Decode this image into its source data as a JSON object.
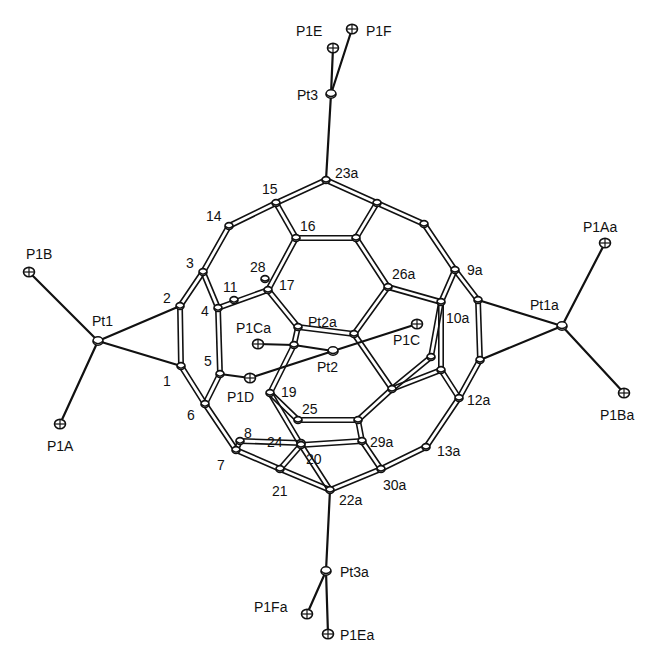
{
  "diagram": {
    "type": "ORTEP molecular structure",
    "atoms": [
      {
        "id": "P1E",
        "x": 333,
        "y": 48,
        "kind": "P",
        "label": "P1E",
        "lx": 296,
        "ly": 36
      },
      {
        "id": "P1F",
        "x": 352,
        "y": 29,
        "kind": "P",
        "label": "P1F",
        "lx": 366,
        "ly": 36
      },
      {
        "id": "Pt3",
        "x": 331,
        "y": 94,
        "kind": "Pt",
        "label": "Pt3",
        "lx": 297,
        "ly": 100
      },
      {
        "id": "C23a",
        "x": 326,
        "y": 180,
        "kind": "C",
        "label": "23a",
        "lx": 335,
        "ly": 178
      },
      {
        "id": "C15",
        "x": 276,
        "y": 203,
        "kind": "C",
        "label": "15",
        "lx": 262,
        "ly": 194
      },
      {
        "id": "C14",
        "x": 229,
        "y": 226,
        "kind": "C",
        "label": "14",
        "lx": 206,
        "ly": 221
      },
      {
        "id": "C16",
        "x": 296,
        "y": 238,
        "kind": "C",
        "label": "16",
        "lx": 300,
        "ly": 231
      },
      {
        "id": "Cb1",
        "x": 377,
        "y": 203,
        "kind": "C",
        "label": "",
        "lx": 0,
        "ly": 0
      },
      {
        "id": "Cb2",
        "x": 356,
        "y": 238,
        "kind": "C",
        "label": "",
        "lx": 0,
        "ly": 0
      },
      {
        "id": "Cb3",
        "x": 424,
        "y": 224,
        "kind": "C",
        "label": "",
        "lx": 0,
        "ly": 0
      },
      {
        "id": "C3",
        "x": 203,
        "y": 272,
        "kind": "C",
        "label": "3",
        "lx": 186,
        "ly": 268
      },
      {
        "id": "C28",
        "x": 265,
        "y": 279,
        "kind": "C",
        "label": "28",
        "lx": 250,
        "ly": 272
      },
      {
        "id": "C17",
        "x": 268,
        "y": 290,
        "kind": "C",
        "label": "17",
        "lx": 279,
        "ly": 290
      },
      {
        "id": "C11",
        "x": 234,
        "y": 300,
        "kind": "C",
        "label": "11",
        "lx": 223,
        "ly": 292
      },
      {
        "id": "C4",
        "x": 218,
        "y": 308,
        "kind": "C",
        "label": "4",
        "lx": 201,
        "ly": 316
      },
      {
        "id": "C26a",
        "x": 388,
        "y": 287,
        "kind": "C",
        "label": "26a",
        "lx": 392,
        "ly": 279
      },
      {
        "id": "C9a",
        "x": 455,
        "y": 270,
        "kind": "C",
        "label": "9a",
        "lx": 467,
        "ly": 275
      },
      {
        "id": "C10a",
        "x": 441,
        "y": 302,
        "kind": "C",
        "label": "10a",
        "lx": 446,
        "ly": 323
      },
      {
        "id": "Cr1",
        "x": 478,
        "y": 300,
        "kind": "C",
        "label": "",
        "lx": 0,
        "ly": 0
      },
      {
        "id": "C2",
        "x": 180,
        "y": 306,
        "kind": "C",
        "label": "2",
        "lx": 163,
        "ly": 303
      },
      {
        "id": "Pt1",
        "x": 98,
        "y": 341,
        "kind": "Pt",
        "label": "Pt1",
        "lx": 92,
        "ly": 326
      },
      {
        "id": "P1B",
        "x": 29,
        "y": 272,
        "kind": "P",
        "label": "P1B",
        "lx": 26,
        "ly": 259
      },
      {
        "id": "P1A",
        "x": 60,
        "y": 424,
        "kind": "P",
        "label": "P1A",
        "lx": 47,
        "ly": 451
      },
      {
        "id": "C1",
        "x": 181,
        "y": 366,
        "kind": "C",
        "label": "1",
        "lx": 163,
        "ly": 386
      },
      {
        "id": "C5",
        "x": 220,
        "y": 374,
        "kind": "C",
        "label": "5",
        "lx": 204,
        "ly": 366
      },
      {
        "id": "C6",
        "x": 205,
        "y": 404,
        "kind": "C",
        "label": "6",
        "lx": 187,
        "ly": 420
      },
      {
        "id": "Pt2",
        "x": 333,
        "y": 351,
        "kind": "Pt",
        "label": "Pt2",
        "lx": 317,
        "ly": 372
      },
      {
        "id": "Pt2a",
        "x": 354,
        "y": 334,
        "kind": "C",
        "label": "Pt2a",
        "lx": 308,
        "ly": 327
      },
      {
        "id": "Cc1",
        "x": 298,
        "y": 327,
        "kind": "C",
        "label": "",
        "lx": 0,
        "ly": 0
      },
      {
        "id": "Cc2",
        "x": 294,
        "y": 345,
        "kind": "C",
        "label": "",
        "lx": 0,
        "ly": 0
      },
      {
        "id": "P1Ca",
        "x": 258,
        "y": 344,
        "kind": "P",
        "label": "P1Ca",
        "lx": 236,
        "ly": 333
      },
      {
        "id": "P1C",
        "x": 417,
        "y": 324,
        "kind": "P",
        "label": "P1C",
        "lx": 393,
        "ly": 345
      },
      {
        "id": "P1D",
        "x": 250,
        "y": 378,
        "kind": "P",
        "label": "P1D",
        "lx": 227,
        "ly": 402
      },
      {
        "id": "C19",
        "x": 270,
        "y": 393,
        "kind": "C",
        "label": "19",
        "lx": 281,
        "ly": 397
      },
      {
        "id": "Cd1",
        "x": 431,
        "y": 357,
        "kind": "C",
        "label": "",
        "lx": 0,
        "ly": 0
      },
      {
        "id": "Cd2",
        "x": 441,
        "y": 370,
        "kind": "C",
        "label": "",
        "lx": 0,
        "ly": 0
      },
      {
        "id": "Cd3",
        "x": 392,
        "y": 389,
        "kind": "C",
        "label": "",
        "lx": 0,
        "ly": 0
      },
      {
        "id": "Pt1a",
        "x": 562,
        "y": 326,
        "kind": "Pt",
        "label": "Pt1a",
        "lx": 530,
        "ly": 310
      },
      {
        "id": "P1Aa",
        "x": 605,
        "y": 243,
        "kind": "P",
        "label": "P1Aa",
        "lx": 583,
        "ly": 232
      },
      {
        "id": "P1Ba",
        "x": 624,
        "y": 393,
        "kind": "P",
        "label": "P1Ba",
        "lx": 600,
        "ly": 420
      },
      {
        "id": "Cr2",
        "x": 480,
        "y": 360,
        "kind": "C",
        "label": "",
        "lx": 0,
        "ly": 0
      },
      {
        "id": "C12a",
        "x": 459,
        "y": 398,
        "kind": "C",
        "label": "12a",
        "lx": 467,
        "ly": 405
      },
      {
        "id": "C25",
        "x": 298,
        "y": 420,
        "kind": "C",
        "label": "25",
        "lx": 302,
        "ly": 414
      },
      {
        "id": "Ce1",
        "x": 358,
        "y": 420,
        "kind": "C",
        "label": "",
        "lx": 0,
        "ly": 0
      },
      {
        "id": "C24",
        "x": 301,
        "y": 443,
        "kind": "C",
        "label": "24",
        "lx": 267,
        "ly": 447
      },
      {
        "id": "C20",
        "x": 301,
        "y": 445,
        "kind": "C",
        "label": "20",
        "lx": 306,
        "ly": 464
      },
      {
        "id": "C29a",
        "x": 362,
        "y": 441,
        "kind": "C",
        "label": "29a",
        "lx": 370,
        "ly": 447
      },
      {
        "id": "C13a",
        "x": 426,
        "y": 447,
        "kind": "C",
        "label": "13a",
        "lx": 437,
        "ly": 456
      },
      {
        "id": "C8",
        "x": 240,
        "y": 441,
        "kind": "C",
        "label": "8",
        "lx": 244,
        "ly": 438
      },
      {
        "id": "C7",
        "x": 236,
        "y": 450,
        "kind": "C",
        "label": "7",
        "lx": 217,
        "ly": 470
      },
      {
        "id": "C21",
        "x": 280,
        "y": 469,
        "kind": "C",
        "label": "21",
        "lx": 272,
        "ly": 496
      },
      {
        "id": "C30a",
        "x": 381,
        "y": 469,
        "kind": "C",
        "label": "30a",
        "lx": 383,
        "ly": 490
      },
      {
        "id": "C22a",
        "x": 330,
        "y": 490,
        "kind": "C",
        "label": "22a",
        "lx": 339,
        "ly": 505
      },
      {
        "id": "Pt3a",
        "x": 326,
        "y": 571,
        "kind": "Pt",
        "label": "Pt3a",
        "lx": 340,
        "ly": 577
      },
      {
        "id": "P1Fa",
        "x": 307,
        "y": 614,
        "kind": "P",
        "label": "P1Fa",
        "lx": 254,
        "ly": 612
      },
      {
        "id": "P1Ea",
        "x": 328,
        "y": 634,
        "kind": "P",
        "label": "P1Ea",
        "lx": 340,
        "ly": 640
      }
    ],
    "bonds": [
      [
        "P1E",
        "Pt3"
      ],
      [
        "P1F",
        "Pt3"
      ],
      [
        "Pt3",
        "C23a"
      ],
      [
        "C23a",
        "C15"
      ],
      [
        "C23a",
        "Cb1"
      ],
      [
        "C15",
        "C14"
      ],
      [
        "C15",
        "C16"
      ],
      [
        "C16",
        "Cb2"
      ],
      [
        "Cb1",
        "Cb2"
      ],
      [
        "Cb1",
        "Cb3"
      ],
      [
        "C14",
        "C3"
      ],
      [
        "C16",
        "C17"
      ],
      [
        "Cb2",
        "C26a"
      ],
      [
        "Cb3",
        "C9a"
      ],
      [
        "C3",
        "C2"
      ],
      [
        "C3",
        "C4"
      ],
      [
        "C4",
        "C17"
      ],
      [
        "C4",
        "C5"
      ],
      [
        "C2",
        "C1"
      ],
      [
        "C2",
        "Pt1"
      ],
      [
        "C1",
        "Pt1"
      ],
      [
        "Pt1",
        "P1B"
      ],
      [
        "Pt1",
        "P1A"
      ],
      [
        "C1",
        "C6"
      ],
      [
        "C5",
        "C6"
      ],
      [
        "C5",
        "P1D"
      ],
      [
        "C26a",
        "C10a"
      ],
      [
        "C9a",
        "C10a"
      ],
      [
        "C9a",
        "Cr1"
      ],
      [
        "Cr1",
        "Pt1a"
      ],
      [
        "Cr2",
        "Pt1a"
      ],
      [
        "Cr1",
        "Cr2"
      ],
      [
        "Pt1a",
        "P1Aa"
      ],
      [
        "Pt1a",
        "P1Ba"
      ],
      [
        "C17",
        "Cc1"
      ],
      [
        "Cc1",
        "Pt2a"
      ],
      [
        "Cc1",
        "Cc2"
      ],
      [
        "Cc2",
        "Pt2"
      ],
      [
        "C26a",
        "Pt2a"
      ],
      [
        "Pt2",
        "P1C"
      ],
      [
        "Pt2",
        "P1D"
      ],
      [
        "Cc2",
        "P1Ca"
      ],
      [
        "C10a",
        "Cd2"
      ],
      [
        "Cd1",
        "Cd3"
      ],
      [
        "Cd2",
        "Cd3"
      ],
      [
        "Cr2",
        "C12a"
      ],
      [
        "Cd2",
        "C12a"
      ],
      [
        "C19",
        "C25"
      ],
      [
        "C19",
        "C20"
      ],
      [
        "Cc2",
        "C19"
      ],
      [
        "C25",
        "Ce1"
      ],
      [
        "Ce1",
        "Cd3"
      ],
      [
        "Ce1",
        "C29a"
      ],
      [
        "C20",
        "C29a"
      ],
      [
        "C12a",
        "C13a"
      ],
      [
        "C29a",
        "C30a"
      ],
      [
        "C13a",
        "C30a"
      ],
      [
        "C6",
        "C7"
      ],
      [
        "C7",
        "C8"
      ],
      [
        "C8",
        "C24"
      ],
      [
        "C7",
        "C21"
      ],
      [
        "C20",
        "C21"
      ],
      [
        "C21",
        "C22a"
      ],
      [
        "C30a",
        "C22a"
      ],
      [
        "C20",
        "C22a"
      ],
      [
        "C22a",
        "Pt3a"
      ],
      [
        "Pt3a",
        "P1Ea"
      ],
      [
        "Pt3a",
        "P1Fa"
      ],
      [
        "Pt2a",
        "Cd3"
      ],
      [
        "Cd1",
        "C10a"
      ]
    ]
  }
}
